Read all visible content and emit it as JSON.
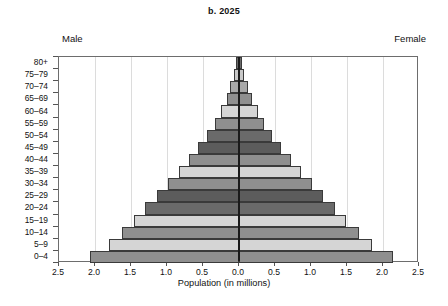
{
  "chart": {
    "title": "b. 2025",
    "male_label": "Male",
    "female_label": "Female"
  },
  "chart_data": {
    "type": "bar",
    "subtype": "population-pyramid",
    "title": "b. 2025",
    "xlabel": "Population (in millions)",
    "ylabel": "",
    "categories": [
      "0–4",
      "5–9",
      "10–14",
      "15–19",
      "20–24",
      "25–29",
      "30–34",
      "35–39",
      "40–44",
      "45–49",
      "50–54",
      "55–59",
      "60–64",
      "65–69",
      "70–74",
      "75–79",
      "80+"
    ],
    "series": [
      {
        "name": "Male",
        "side": "left",
        "values": [
          2.07,
          1.8,
          1.62,
          1.46,
          1.3,
          1.14,
          0.99,
          0.84,
          0.7,
          0.57,
          0.45,
          0.34,
          0.25,
          0.17,
          0.12,
          0.07,
          0.04
        ]
      },
      {
        "name": "Female",
        "side": "right",
        "values": [
          2.14,
          1.85,
          1.66,
          1.49,
          1.33,
          1.17,
          1.01,
          0.86,
          0.72,
          0.59,
          0.46,
          0.35,
          0.26,
          0.18,
          0.12,
          0.07,
          0.04
        ]
      }
    ],
    "xticks": [
      "2.5",
      "2.0",
      "1.5",
      "1.0",
      "0.5",
      "0.0",
      "0.5",
      "1.0",
      "1.5",
      "2.0",
      "2.5"
    ],
    "xtick_values": [
      -2.5,
      -2.0,
      -1.5,
      -1.0,
      -0.5,
      0.0,
      0.5,
      1.0,
      1.5,
      2.0,
      2.5
    ],
    "xlim": [
      -2.5,
      2.5
    ],
    "grid": true,
    "legend": "none",
    "bar_colors": [
      "#8f8f8f",
      "#d5d5d5",
      "#8f8f8f",
      "#d5d5d5",
      "#6a6a6a",
      "#5c5c5c",
      "#8f8f8f",
      "#d5d5d5",
      "#8f8f8f",
      "#5c5c5c",
      "#6a6a6a",
      "#8f8f8f",
      "#d5d5d5",
      "#8f8f8f",
      "#a8a8a8",
      "#c8c8c8",
      "#6a6a6a"
    ],
    "axis_color": "#1a1a1a",
    "grid_color": "#dcdcdc"
  }
}
